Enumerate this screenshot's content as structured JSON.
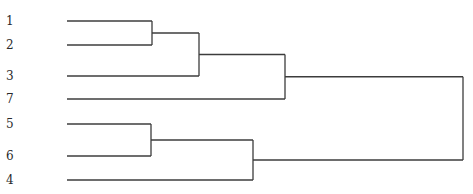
{
  "chart_data": {
    "type": "dendrogram",
    "title": "",
    "orientation": "horizontal",
    "leaf_order": [
      "1",
      "2",
      "3",
      "7",
      "5",
      "6",
      "4"
    ],
    "leaves": [
      {
        "label": "1",
        "y": 21
      },
      {
        "label": "2",
        "y": 45
      },
      {
        "label": "3",
        "y": 76
      },
      {
        "label": "7",
        "y": 99
      },
      {
        "label": "5",
        "y": 124
      },
      {
        "label": "6",
        "y": 156
      },
      {
        "label": "4",
        "y": 180
      }
    ],
    "merges": [
      {
        "id": "A",
        "children": [
          "1",
          "2"
        ],
        "height_px": 152,
        "y_top": 21,
        "y_bottom": 45,
        "y_mid": 34
      },
      {
        "id": "B",
        "children": [
          "A",
          "3"
        ],
        "height_px": 199,
        "y_top": 34,
        "y_bottom": 76,
        "y_mid": 53
      },
      {
        "id": "C",
        "children": [
          "B",
          "7"
        ],
        "height_px": 285,
        "y_top": 53,
        "y_bottom": 99,
        "y_mid": 77
      },
      {
        "id": "D",
        "children": [
          "5",
          "6"
        ],
        "height_px": 151,
        "y_top": 124,
        "y_bottom": 156,
        "y_mid": 140
      },
      {
        "id": "E",
        "children": [
          "D",
          "4"
        ],
        "height_px": 253,
        "y_top": 140,
        "y_bottom": 180,
        "y_mid": 157
      },
      {
        "id": "F",
        "children": [
          "C",
          "E"
        ],
        "height_px": 463,
        "y_top": 77,
        "y_bottom": 157,
        "y_mid": 117
      }
    ],
    "leaf_x_px": 67,
    "xlabel": "",
    "ylabel": ""
  }
}
